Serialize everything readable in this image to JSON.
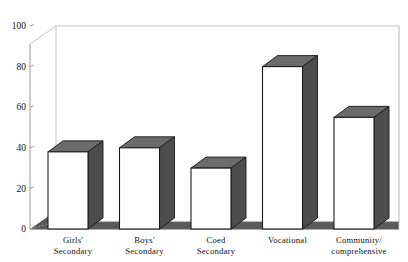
{
  "chart_data": {
    "type": "bar",
    "title": "",
    "subtitle": "",
    "xlabel": "",
    "ylabel": "",
    "categories": [
      "Girls' Secondary",
      "Boys' Secondary",
      "Coed Secondary",
      "Vocational",
      "Community/ comprehensive"
    ],
    "category_lines": [
      [
        "Girls'",
        "Secondary"
      ],
      [
        "Boys'",
        "Secondary"
      ],
      [
        "Coed",
        "Secondary"
      ],
      [
        "Vocational",
        ""
      ],
      [
        "Community/",
        "comprehensive"
      ]
    ],
    "values": [
      38,
      40,
      30,
      80,
      55
    ],
    "ylim": [
      0,
      100
    ],
    "yticks": [
      0,
      20,
      40,
      60,
      80,
      100
    ],
    "ytick_labels": [
      "0",
      "20",
      "40",
      "60",
      "80",
      "100"
    ],
    "grid": false,
    "legend": null,
    "style": "3d-isometric-bars",
    "colors": {
      "bar_front": "#ffffff",
      "bar_side": "#4d4d4d",
      "bar_top": "#6b6b6b",
      "bar_outline": "#1a1a1a",
      "floor": "#5a5a5a",
      "wall": "#ffffff",
      "axis": "#9a9a9a",
      "text": "#111111"
    }
  }
}
